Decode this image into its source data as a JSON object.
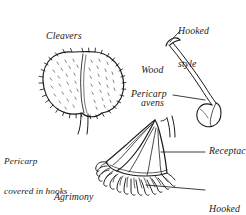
{
  "figure": {
    "kind": "botanical-line-drawing",
    "background_color": "#ffffff",
    "ink_color": "#1a1a1a",
    "caption_style": "italic-serif"
  },
  "specimens": [
    {
      "name": "cleavers",
      "label": "Cleavers",
      "description": "round bilobed burr covered in hooked bristles, on a short stalk"
    },
    {
      "name": "wood-avens",
      "label": "Wood\navens",
      "label_line1": "Wood",
      "label_line2": "avens",
      "description": "single achene with long style terminating in a sharp hook"
    },
    {
      "name": "agrimony",
      "label": "Agrimony",
      "description": "bell shaped ribbed fruit with a fringe of hooked styles around the rim"
    }
  ],
  "annotations": [
    {
      "name": "hooked-style",
      "line1": "Hooked",
      "line2": "style",
      "target": "wood-avens-style-tip",
      "leader": "diagonal"
    },
    {
      "name": "pericarp-right",
      "text": "Pericarp",
      "target": "wood-avens-achene",
      "leader": "dash"
    },
    {
      "name": "pericarp-covered-in-hooks",
      "line1": "Pericarp",
      "line2": "covered in hooks",
      "target": "cleavers-burr",
      "leader": "none"
    },
    {
      "name": "receptacle",
      "text": "Receptacle",
      "target": "agrimony-body",
      "leader": "horizontal"
    },
    {
      "name": "hooked-styles",
      "line1": "Hooked",
      "line2": "styles",
      "target": "agrimony-fringe",
      "leader": "horizontal"
    }
  ]
}
